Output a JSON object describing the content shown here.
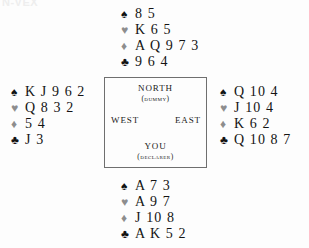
{
  "artifact": {
    "top_text": "N-VEX"
  },
  "suits": {
    "spade": {
      "glyph": "♠",
      "name": "spade-symbol",
      "tone": "black"
    },
    "heart": {
      "glyph": "♥",
      "name": "heart-symbol",
      "tone": "gray"
    },
    "diamond": {
      "glyph": "♦",
      "name": "diamond-symbol",
      "tone": "gray"
    },
    "club": {
      "glyph": "♣",
      "name": "club-symbol",
      "tone": "black"
    }
  },
  "compass": {
    "north": {
      "label": "NORTH",
      "sub": "(DUMMY)"
    },
    "south": {
      "label": "YOU",
      "sub": "(DECLARER)"
    },
    "west": {
      "label": "WEST"
    },
    "east": {
      "label": "EAST"
    }
  },
  "hands": {
    "north": {
      "seat": "North",
      "spades": "8 5",
      "hearts": "K 6 5",
      "diamonds": "A Q 9 7 3",
      "clubs": "9 6 4"
    },
    "west": {
      "seat": "West",
      "spades": "K J 9 6 2",
      "hearts": "Q 8 3 2",
      "diamonds": "5 4",
      "clubs": "J 3"
    },
    "east": {
      "seat": "East",
      "spades": "Q 10 4",
      "hearts": "J 10 4",
      "diamonds": "K 6 2",
      "clubs": "Q 10 8 7"
    },
    "south": {
      "seat": "South",
      "spades": "A 7 3",
      "hearts": "A 9 7",
      "diamonds": "J 10 8",
      "clubs": "A K 5 2"
    }
  },
  "colors": {
    "background": "#fdfdfd",
    "ink": "#141414",
    "gray_suit": "#8d8d8d",
    "box_border": "#6f6f6f"
  }
}
